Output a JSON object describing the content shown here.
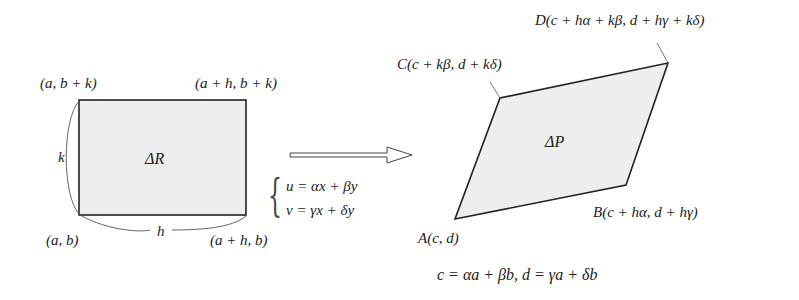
{
  "diagram": {
    "type": "linear-transformation-area-mapping",
    "left_figure": {
      "shape": "rectangle",
      "area_label": "ΔR",
      "corners": {
        "bottom_left": "(a, b)",
        "bottom_right": "(a + h, b)",
        "top_left": "(a, b + k)",
        "top_right": "(a + h, b + k)"
      },
      "side_labels": {
        "height": "k",
        "width": "h"
      },
      "fill_color": "#eeeeee",
      "stroke_color": "#222222"
    },
    "transform": {
      "arrow": "hollow-right-arrow",
      "equations": [
        "u = αx + βy",
        "v = γx + δy"
      ]
    },
    "right_figure": {
      "shape": "parallelogram",
      "area_label": "ΔP",
      "vertices": {
        "A": "A(c, d)",
        "B": "B(c + hα, d + hγ)",
        "C": "C(c + kβ, d + kδ)",
        "D": "D(c + hα + kβ, d + hγ + kδ)"
      },
      "fill_color": "#eeeeee",
      "stroke_color": "#222222"
    },
    "footnote": "c = αa + βb,  d = γa + δb"
  }
}
